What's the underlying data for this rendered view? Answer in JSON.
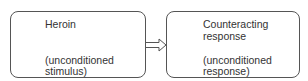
{
  "diagram": {
    "left_box": {
      "title": "Heroin",
      "subtitle_line1": "(unconditioned",
      "subtitle_line2": "stimulus)"
    },
    "right_box": {
      "title_line1": "Counteracting",
      "title_line2": "response",
      "subtitle_line1": "(unconditioned",
      "subtitle_line2": "response)"
    },
    "arrow": "hollow-right-arrow"
  }
}
